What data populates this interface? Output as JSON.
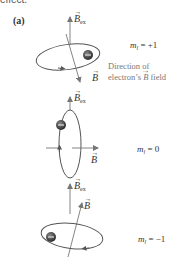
{
  "cut_text": "effect.",
  "panel_label": "(a)",
  "symbols": {
    "b_ex": "B",
    "b_ex_sub": "ex",
    "b": "B"
  },
  "states": [
    {
      "ml_label": "m",
      "ml_sub": "l",
      "ml_value": " = +1"
    },
    {
      "ml_label": "m",
      "ml_sub": "l",
      "ml_value": " = 0"
    },
    {
      "ml_label": "m",
      "ml_sub": "l",
      "ml_value": " = −1"
    }
  ],
  "annotation": {
    "line1": "Direction of",
    "line2_a": "electron’s ",
    "line2_b": "B",
    "line2_c": " field"
  },
  "colors": {
    "orbit": "#555555",
    "arrow": "#777777",
    "electron": "#3a3a3a",
    "text": "#333333",
    "caption": "#777777"
  }
}
